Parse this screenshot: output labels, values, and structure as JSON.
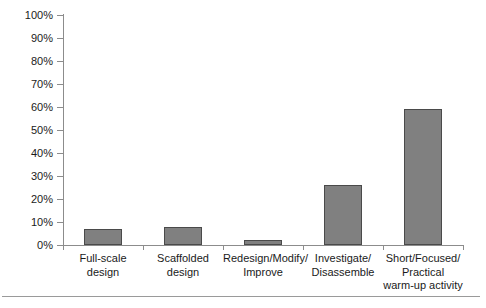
{
  "chart_data": {
    "type": "bar",
    "title": "",
    "subtitle": "",
    "xlabel": "",
    "ylabel": "",
    "categories": [
      "Full-scale design",
      "Scaffolded design",
      "Redesign/Modify/ Improve",
      "Investigate/ Disassemble",
      "Short/Focused/ Practical warm-up activity"
    ],
    "category_lines": [
      [
        "Full-scale",
        "design"
      ],
      [
        "Scaffolded",
        "design"
      ],
      [
        "Redesign/Modify/",
        "Improve"
      ],
      [
        "Investigate/",
        "Disassemble"
      ],
      [
        "Short/Focused/",
        "Practical",
        "warm-up activity"
      ]
    ],
    "values": [
      7,
      8,
      2,
      26,
      59
    ],
    "value_labels": [
      "7%",
      "8%",
      "2%",
      "26%",
      "59%"
    ],
    "ylim": [
      0,
      100
    ],
    "y_ticks": [
      0,
      10,
      20,
      30,
      40,
      50,
      60,
      70,
      80,
      90,
      100
    ],
    "y_tick_labels": [
      "0%",
      "10%",
      "20%",
      "30%",
      "40%",
      "50%",
      "60%",
      "70%",
      "80%",
      "90%",
      "100%"
    ],
    "grid": false,
    "legend": false,
    "legend_position": "none",
    "bar_color": "#808080",
    "bar_edge_color": "#4a4a4a",
    "axis_color": "#8c8c8c",
    "background_color": "#ffffff",
    "text_color": "#1a1a1a"
  }
}
